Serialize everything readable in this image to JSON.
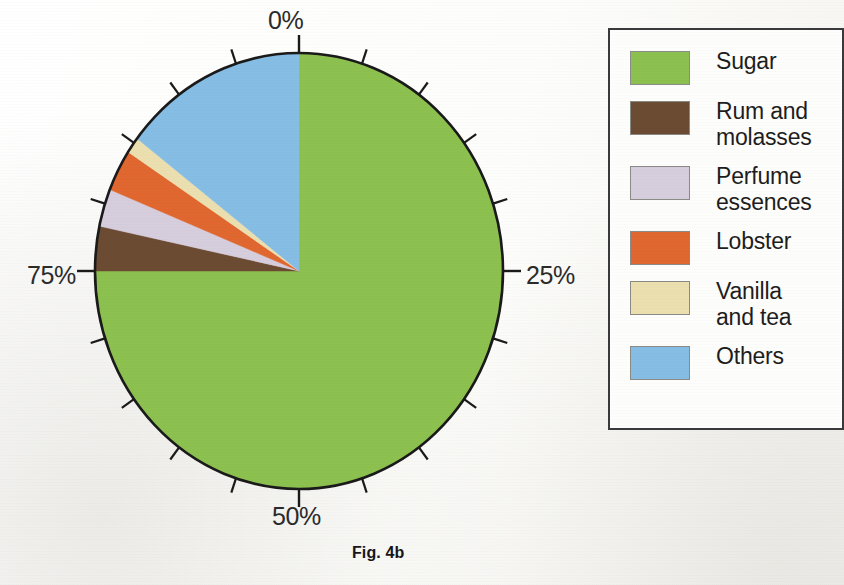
{
  "figure": {
    "caption": "Fig. 4b"
  },
  "axis": {
    "tick_labels": [
      "0%",
      "25%",
      "50%",
      "75%"
    ],
    "tick_interval_percent": 5
  },
  "legend": {
    "border_color": "#3a3a3c",
    "entries": [
      {
        "label": "Sugar",
        "color": "#8cc04f",
        "swatch_name": "legend-swatch-sugar"
      },
      {
        "label": "Rum and\nmolasses",
        "color": "#6b4b32",
        "swatch_name": "legend-swatch-rum-and-molasses"
      },
      {
        "label": "Perfume\nessences",
        "color": "#d6cddd",
        "swatch_name": "legend-swatch-perfume-essences"
      },
      {
        "label": "Lobster",
        "color": "#e0672f",
        "swatch_name": "legend-swatch-lobster"
      },
      {
        "label": "Vanilla\nand tea",
        "color": "#ecdfaf",
        "swatch_name": "legend-swatch-vanilla-and-tea"
      },
      {
        "label": "Others",
        "color": "#86bde4",
        "swatch_name": "legend-swatch-others"
      }
    ]
  },
  "chart_data": {
    "type": "pie",
    "title": "Fig. 4b",
    "subtitle": "",
    "xlabel": "",
    "ylabel": "",
    "grid": false,
    "legend_position": "right",
    "units": "percent",
    "start_angle_deg": 0,
    "direction": "clockwise",
    "axis_ticks_percent": [
      0,
      25,
      50,
      75
    ],
    "axis_minor_tick_step_percent": 5,
    "labels": [
      "Sugar",
      "Rum and molasses",
      "Perfume essences",
      "Lobster",
      "Vanilla and tea",
      "Others"
    ],
    "values": [
      75.0,
      3.3,
      2.8,
      3.1,
      1.2,
      14.6
    ],
    "colors": [
      "#8cc04f",
      "#6b4b32",
      "#d6cddd",
      "#e0672f",
      "#ecdfaf",
      "#86bde4"
    ],
    "slices": [
      {
        "label": "Sugar",
        "value": 75.0,
        "color": "#8cc04f",
        "start_percent": 0.0,
        "end_percent": 75.0
      },
      {
        "label": "Rum and molasses",
        "value": 3.3,
        "color": "#6b4b32",
        "start_percent": 75.0,
        "end_percent": 78.3
      },
      {
        "label": "Perfume essences",
        "value": 2.8,
        "color": "#d6cddd",
        "start_percent": 78.3,
        "end_percent": 81.1
      },
      {
        "label": "Lobster",
        "value": 3.1,
        "color": "#e0672f",
        "start_percent": 81.1,
        "end_percent": 84.2
      },
      {
        "label": "Vanilla and tea",
        "value": 1.2,
        "color": "#ecdfaf",
        "start_percent": 84.2,
        "end_percent": 85.4
      },
      {
        "label": "Others",
        "value": 14.6,
        "color": "#86bde4",
        "start_percent": 85.4,
        "end_percent": 100.0
      }
    ]
  }
}
